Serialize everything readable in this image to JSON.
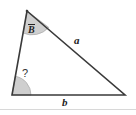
{
  "figure": {
    "type": "triangle-geometry-diagram",
    "width": 136,
    "height": 115,
    "background_color": "#ffffff"
  },
  "labels": {
    "angle_top": "B",
    "angle_top_notation": "overbar",
    "angle_bottom_left": "?",
    "side_hypotenuse": "a",
    "side_base": "b"
  },
  "geometry": {
    "vertices": {
      "top": {
        "x": 27,
        "y": 11
      },
      "bottom_left": {
        "x": 12,
        "y": 95
      },
      "bottom_right": {
        "x": 125,
        "y": 95
      }
    },
    "sides": [
      {
        "name": "left-side",
        "from": "top",
        "to": "bottom_left",
        "label": ""
      },
      {
        "name": "hypotenuse",
        "from": "top",
        "to": "bottom_right",
        "label": "a"
      },
      {
        "name": "base",
        "from": "bottom_left",
        "to": "bottom_right",
        "label": "b"
      }
    ],
    "angle_markers": [
      {
        "name": "angle-top-vertex",
        "at": "top",
        "label": "B",
        "fill": "#cfcfcf",
        "radius": 22
      },
      {
        "name": "angle-bottom-left-vertex",
        "at": "bottom_left",
        "label": "?",
        "fill": "#cfcfcf",
        "radius": 19
      }
    ]
  },
  "colors": {
    "stroke": "#3a3a3a",
    "angle_fill": "#cfcfcf",
    "angle_stroke": "#a8a8a8",
    "text": "#222222",
    "separator": "#d8d8d8"
  },
  "separator": {
    "visible": true,
    "y": 109
  }
}
